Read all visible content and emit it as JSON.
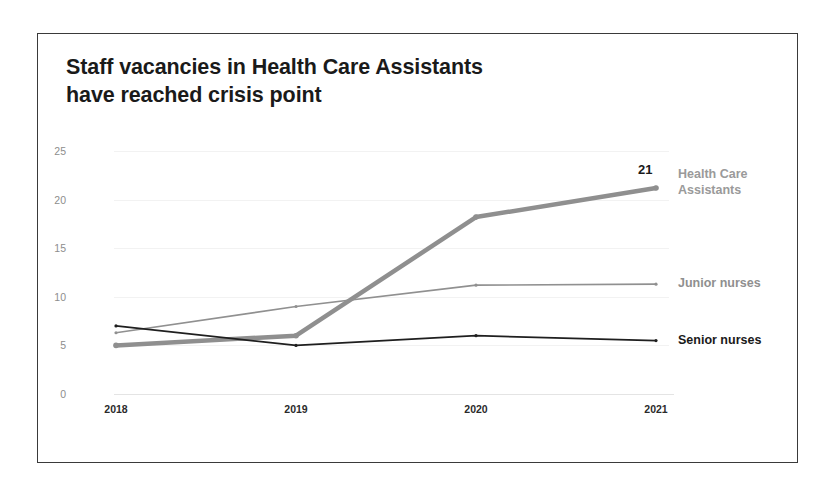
{
  "chart_data": {
    "type": "line",
    "title": "Staff vacancies in Health Care Assistants have reached crisis point",
    "title_line1": "Staff vacancies in Health Care Assistants",
    "title_line2": "have reached crisis point",
    "xlabel": "",
    "ylabel": "",
    "categories": [
      "2018",
      "2019",
      "2020",
      "2021"
    ],
    "x": [
      2018,
      2019,
      2020,
      2021
    ],
    "ylim": [
      0,
      25
    ],
    "yticks": [
      0,
      5,
      10,
      15,
      20,
      25
    ],
    "ytick_labels": [
      "0",
      "5",
      "10",
      "15",
      "20",
      "25"
    ],
    "grid": true,
    "legend_position": "right-of-line-ends",
    "series": [
      {
        "name": "Health Care Assistants",
        "label_line1": "Health Care",
        "label_line2": "Assistants",
        "values": [
          5.0,
          6.0,
          18.2,
          21.2
        ],
        "color": "#8f8f8f",
        "width": 4.5,
        "endpoint_label": "21"
      },
      {
        "name": "Junior nurses",
        "label_line1": "Junior nurses",
        "label_line2": "",
        "values": [
          6.3,
          9.0,
          11.2,
          11.3
        ],
        "color": "#909090",
        "width": 1.6,
        "endpoint_label": ""
      },
      {
        "name": "Senior nurses",
        "label_line1": "Senior nurses",
        "label_line2": "",
        "values": [
          7.0,
          5.0,
          6.0,
          5.5
        ],
        "color": "#1f1f1f",
        "width": 1.8,
        "endpoint_label": ""
      }
    ]
  }
}
